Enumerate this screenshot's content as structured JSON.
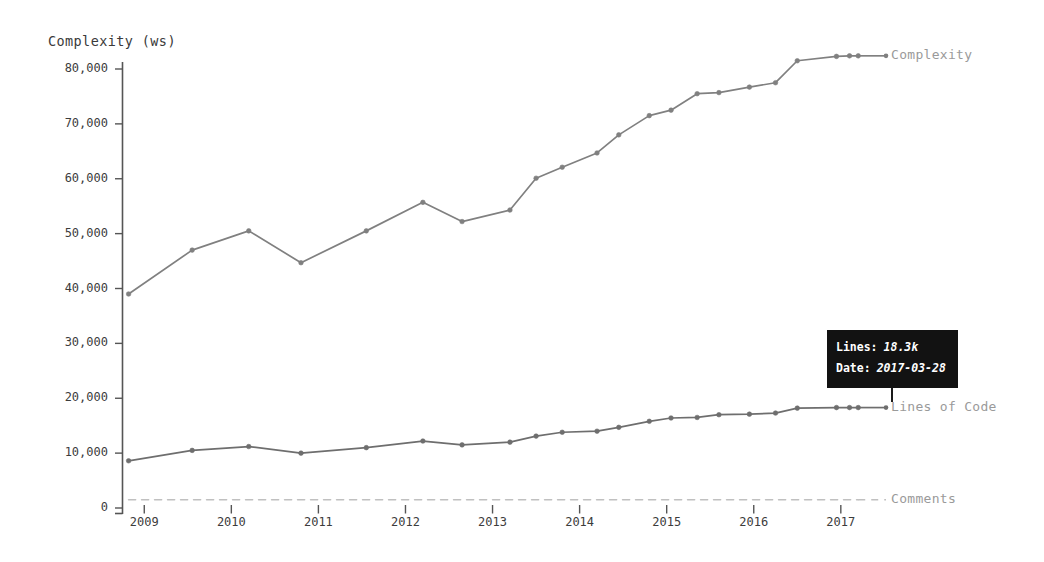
{
  "chart_data": {
    "type": "line",
    "title": "",
    "ylabel": "Complexity (ws)",
    "xlabel": "",
    "ylim": [
      0,
      82000
    ],
    "xlim": [
      2008.75,
      2017.45
    ],
    "yticks": [
      0,
      10000,
      20000,
      30000,
      40000,
      50000,
      60000,
      70000,
      80000
    ],
    "ytick_labels": [
      "0",
      "10,000",
      "20,000",
      "30,000",
      "40,000",
      "50,000",
      "60,000",
      "70,000",
      "80,000"
    ],
    "xticks": [
      2009,
      2010,
      2011,
      2012,
      2013,
      2014,
      2015,
      2016,
      2017
    ],
    "xtick_labels": [
      "2009",
      "2010",
      "2011",
      "2012",
      "2013",
      "2014",
      "2015",
      "2016",
      "2017"
    ],
    "grid": false,
    "legend_position": "right-of-line-end",
    "series": [
      {
        "name": "Complexity",
        "style": "solid",
        "color": "#808080",
        "markers": true,
        "x": [
          2008.82,
          2009.55,
          2010.2,
          2010.8,
          2011.55,
          2012.2,
          2012.65,
          2013.2,
          2013.5,
          2013.8,
          2014.2,
          2014.45,
          2014.8,
          2015.05,
          2015.35,
          2015.6,
          2015.95,
          2016.25,
          2016.5,
          2016.95,
          2017.1,
          2017.2
        ],
        "values": [
          39000,
          47000,
          50500,
          44700,
          50500,
          55700,
          52200,
          54300,
          60100,
          62100,
          64700,
          68000,
          71500,
          72500,
          75500,
          75700,
          76700,
          77500,
          81500,
          82300,
          82400,
          82400
        ]
      },
      {
        "name": "Lines of Code",
        "style": "solid",
        "color": "#6e6e6e",
        "markers": true,
        "x": [
          2008.82,
          2009.55,
          2010.2,
          2010.8,
          2011.55,
          2012.2,
          2012.65,
          2013.2,
          2013.5,
          2013.8,
          2014.2,
          2014.45,
          2014.8,
          2015.05,
          2015.35,
          2015.6,
          2015.95,
          2016.25,
          2016.5,
          2016.95,
          2017.1,
          2017.2
        ],
        "values": [
          8600,
          10500,
          11200,
          10000,
          11000,
          12200,
          11500,
          12000,
          13100,
          13800,
          14000,
          14700,
          15800,
          16400,
          16500,
          17000,
          17100,
          17300,
          18200,
          18300,
          18300,
          18300
        ]
      },
      {
        "name": "Comments",
        "style": "dashed",
        "color": "#c0c0c0",
        "markers": false,
        "x": [
          2008.82,
          2017.2
        ],
        "values": [
          1500,
          1500
        ]
      }
    ]
  },
  "legend": {
    "items": [
      {
        "label": "Complexity"
      },
      {
        "label": "Lines of Code"
      },
      {
        "label": "Comments"
      }
    ]
  },
  "tooltip": {
    "rows": [
      {
        "key": "Lines:",
        "value": "18.3k"
      },
      {
        "key": "Date:",
        "value": "2017-03-28"
      }
    ]
  }
}
